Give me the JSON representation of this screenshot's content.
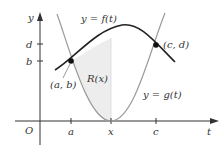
{
  "figure": {
    "axes": {
      "x_label": "t",
      "y_label": "y",
      "origin_label": "O",
      "x_ticks": [
        "a",
        "x",
        "c"
      ],
      "y_ticks": [
        "d",
        "b"
      ]
    },
    "curves": {
      "f": {
        "label": "y = f(t)",
        "color": "#222222"
      },
      "g": {
        "label": "y = g(t)",
        "color": "#9a9a9a"
      }
    },
    "points": {
      "left": {
        "label": "(a, b)"
      },
      "right": {
        "label": "(c, d)"
      }
    },
    "region": {
      "label": "R(x)",
      "fill": "#ededed"
    }
  }
}
